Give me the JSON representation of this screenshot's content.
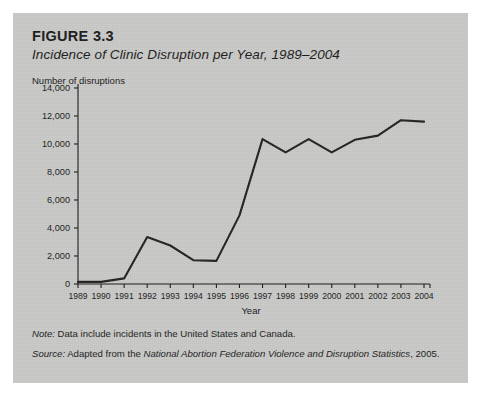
{
  "figure": {
    "label": "FIGURE 3.3",
    "title": "Incidence of Clinic Disruption per Year, 1989–2004",
    "note_lead": "Note:",
    "note_text": " Data include incidents in the United States and Canada.",
    "source_lead": "Source:",
    "source_text_pre": " Adapted from the ",
    "source_text_italic": "National Abortion Federation Violence and Disruption Statistics",
    "source_text_post": ", 2005."
  },
  "colors": {
    "panel_background": "#c9c9c7",
    "page_background": "#ffffff",
    "line": "#222222",
    "axis": "#1b1b1b",
    "text": "#1b1b1b"
  },
  "chart_data": {
    "type": "line",
    "title": "Incidence of Clinic Disruption per Year, 1989–2004",
    "xlabel": "Year",
    "ylabel": "Number of disruptions",
    "ylim": [
      0,
      14000
    ],
    "yticks": [
      0,
      2000,
      4000,
      6000,
      8000,
      10000,
      12000,
      14000
    ],
    "ytick_labels": [
      "0",
      "2,000",
      "4,000",
      "6,000",
      "8,000",
      "10,000",
      "12,000",
      "14,000"
    ],
    "grid": false,
    "legend": null,
    "categories": [
      "1989",
      "1990",
      "1991",
      "1992",
      "1993",
      "1994",
      "1995",
      "1996",
      "1997",
      "1998",
      "1999",
      "2000",
      "2001",
      "2002",
      "2003",
      "2004"
    ],
    "x": [
      1989,
      1990,
      1991,
      1992,
      1993,
      1994,
      1995,
      1996,
      1997,
      1998,
      1999,
      2000,
      2001,
      2002,
      2003,
      2004
    ],
    "values": [
      150,
      150,
      400,
      3350,
      2750,
      1700,
      1650,
      4900,
      10350,
      9400,
      10350,
      9400,
      10300,
      10600,
      11700,
      11600
    ],
    "series": [
      {
        "name": "Number of disruptions",
        "values": [
          150,
          150,
          400,
          3350,
          2750,
          1700,
          1650,
          4900,
          10350,
          9400,
          10350,
          9400,
          10300,
          10600,
          11700,
          11600
        ]
      }
    ]
  }
}
